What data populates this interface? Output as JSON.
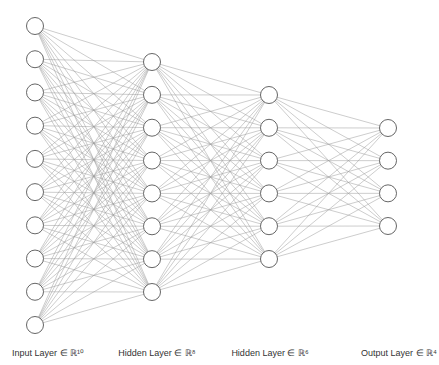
{
  "diagram": {
    "type": "fully-connected-neural-network",
    "colors": {
      "edge": "#9a9a9a",
      "node_stroke": "#555555",
      "node_fill": "#ffffff",
      "label": "#333333"
    },
    "node_radius": 8.5,
    "layers": [
      {
        "name": "input",
        "label": "Input Layer ∈ ℝ¹⁰",
        "size": 10,
        "x": 35,
        "y_start": 26,
        "y_end": 325,
        "label_x": 48
      },
      {
        "name": "hidden-1",
        "label": "Hidden Layer ∈ ℝ⁸",
        "size": 8,
        "x": 152,
        "y_start": 62,
        "y_end": 292,
        "label_x": 157
      },
      {
        "name": "hidden-2",
        "label": "Hidden Layer ∈ ℝ⁶",
        "size": 6,
        "x": 269,
        "y_start": 95,
        "y_end": 259,
        "label_x": 270
      },
      {
        "name": "output",
        "label": "Output Layer ∈ ℝ⁴",
        "size": 4,
        "x": 388,
        "y_start": 128,
        "y_end": 226,
        "label_x": 399
      }
    ]
  }
}
